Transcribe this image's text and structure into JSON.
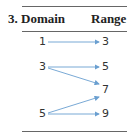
{
  "header": {
    "exercise_number": "3.",
    "domain_label": "Domain",
    "range_label": "Range"
  },
  "domain": [
    "1",
    "3",
    "5"
  ],
  "range": [
    "3",
    "5",
    "7",
    "9"
  ],
  "mapping": [
    {
      "from": "1",
      "to": "3"
    },
    {
      "from": "3",
      "to": "5"
    },
    {
      "from": "3",
      "to": "7"
    },
    {
      "from": "5",
      "to": "7"
    },
    {
      "from": "5",
      "to": "9"
    }
  ],
  "colors": {
    "arrow": "#6a9fd0",
    "rule": "#666666",
    "text": "#333333"
  }
}
